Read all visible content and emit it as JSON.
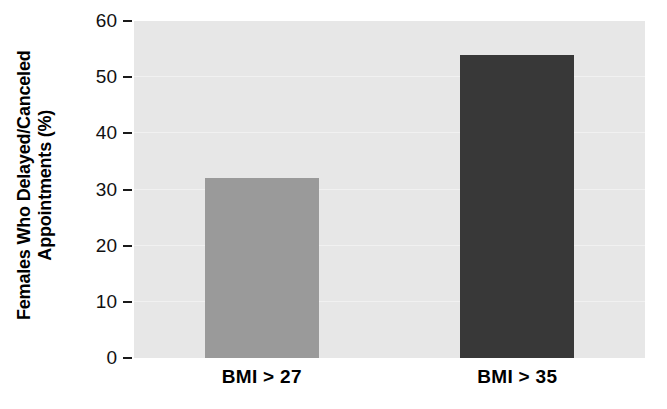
{
  "chart_data": {
    "type": "bar",
    "title": "",
    "xlabel": "",
    "ylabel_line1": "Females Who Delayed/Canceled",
    "ylabel_line2": "Appointments (%)",
    "ylabel": "Females Who Delayed/Canceled Appointments (%)",
    "categories": [
      "BMI > 27",
      "BMI > 35"
    ],
    "values": [
      32,
      54
    ],
    "ylim": [
      0,
      60
    ],
    "yticks": [
      0,
      10,
      20,
      30,
      40,
      50,
      60
    ],
    "ytick_labels": [
      "0",
      "10",
      "20",
      "30",
      "40",
      "50",
      "60"
    ],
    "grid": true,
    "legend": "none",
    "bar_colors": [
      "#9a9a9a",
      "#383838"
    ],
    "plot_background": "#e7e7e7",
    "figure_background": "#ffffff",
    "grid_color": "#f1f1f1",
    "tick_color": "#1a1a1a"
  }
}
